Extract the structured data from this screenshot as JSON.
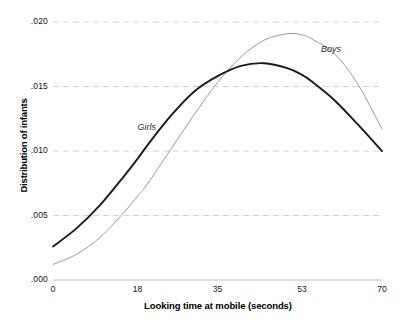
{
  "chart_data": {
    "type": "line",
    "title": "",
    "xlabel": "Looking time at mobile (seconds)",
    "ylabel": "Distribution of infants",
    "xlim": [
      0,
      70
    ],
    "ylim": [
      0.0,
      0.02
    ],
    "grid": true,
    "grid_axis": "y",
    "legend_position": "inline-annotations",
    "xticks": [
      0,
      18,
      35,
      53,
      70
    ],
    "xtick_labels": [
      "0",
      "18",
      "35",
      "53",
      "70"
    ],
    "yticks": [
      0.0,
      0.005,
      0.01,
      0.015,
      0.02
    ],
    "ytick_labels": [
      ".000",
      ".005",
      ".010",
      ".015",
      ".020"
    ],
    "series": [
      {
        "name": "Girls",
        "style": "solid-thick-dark",
        "color": "#1a1a1a",
        "annotation_label": "Girls",
        "x": [
          0,
          5,
          10,
          15,
          18,
          20,
          25,
          30,
          35,
          40,
          45,
          50,
          53,
          55,
          60,
          65,
          70
        ],
        "values": [
          0.0026,
          0.004,
          0.0058,
          0.008,
          0.0094,
          0.0104,
          0.0127,
          0.0146,
          0.0158,
          0.0166,
          0.0168,
          0.0164,
          0.0159,
          0.0154,
          0.0139,
          0.012,
          0.01
        ]
      },
      {
        "name": "Boys",
        "style": "solid-thin-light",
        "color": "#9a9a9a",
        "annotation_label": "Boys",
        "x": [
          0,
          5,
          10,
          15,
          18,
          20,
          25,
          30,
          35,
          40,
          45,
          50,
          53,
          55,
          60,
          65,
          70
        ],
        "values": [
          0.0012,
          0.002,
          0.0033,
          0.0052,
          0.0065,
          0.0074,
          0.0101,
          0.0128,
          0.0153,
          0.0173,
          0.0186,
          0.0191,
          0.019,
          0.0187,
          0.0175,
          0.0151,
          0.0117
        ]
      }
    ],
    "annotations": [
      {
        "label": "Girls",
        "x": 18,
        "y": 0.0118
      },
      {
        "label": "Boys",
        "x": 57,
        "y": 0.0178
      }
    ]
  }
}
